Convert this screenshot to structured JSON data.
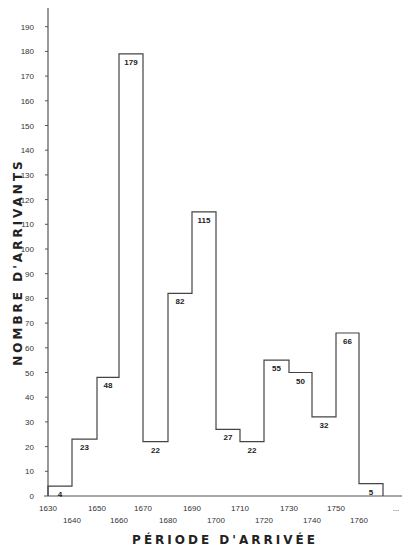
{
  "chart_data": {
    "type": "bar",
    "subtype": "histogram-step",
    "title": "",
    "xlabel": "PÉRIODE D'ARRIVÉE",
    "ylabel": "NOMBRE D'ARRIVANTS",
    "ylim": [
      0,
      195
    ],
    "yticks": [
      0,
      10,
      20,
      30,
      40,
      50,
      60,
      70,
      80,
      90,
      100,
      110,
      120,
      130,
      140,
      150,
      160,
      170,
      180,
      190
    ],
    "xticks": [
      "1630",
      "1640",
      "1650",
      "1660",
      "1670",
      "1680",
      "1690",
      "1700",
      "1710",
      "1720",
      "1730",
      "1740",
      "1750",
      "1760",
      "..."
    ],
    "categories": [
      "1630-1640",
      "1640-1650",
      "1650-1660",
      "1660-1670",
      "1670-1680",
      "1680-1690",
      "1690-1700",
      "1700-1710",
      "1710-1720",
      "1720-1730",
      "1730-1740",
      "1740-1750",
      "1750-1760",
      "1760-..."
    ],
    "values": [
      4,
      23,
      48,
      179,
      22,
      82,
      115,
      27,
      22,
      55,
      50,
      32,
      66,
      5
    ],
    "value_labels": [
      "4",
      "23",
      "48",
      "179",
      "22",
      "82",
      "115",
      "27",
      "22",
      "55",
      "50",
      "32",
      "66",
      "5"
    ],
    "grid": false,
    "legend": null
  }
}
